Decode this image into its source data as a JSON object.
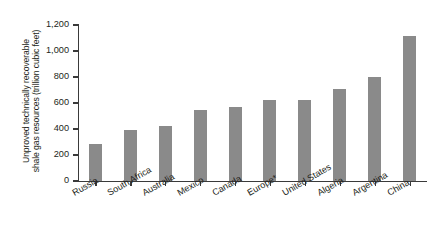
{
  "chart_data": {
    "type": "bar",
    "title": "",
    "subtitle": "",
    "xlabel": "",
    "ylabel": "Unproved technically recoverable shale gas resources (trillion cubic feet)",
    "ylabel_lines": [
      "Unproved technically recoverable",
      "shale gas resources (trillion cubic feet)"
    ],
    "categories": [
      "Russia",
      "South Africa",
      "Australia",
      "Mexico",
      "Canada",
      "Europe*",
      "United States",
      "Algeria",
      "Argentina",
      "China"
    ],
    "values": [
      285,
      390,
      425,
      545,
      573,
      622,
      622,
      707,
      802,
      1115
    ],
    "ylim": [
      0,
      1200
    ],
    "ytick_values": [
      0,
      200,
      400,
      600,
      800,
      1000,
      1200
    ],
    "ytick_labels": [
      "0",
      "200",
      "400",
      "600",
      "800",
      "1,000",
      "1,200"
    ],
    "grid": false,
    "legend": false,
    "legend_position": "none",
    "bar_color": "#8a8a8a",
    "axis_color": "#3a3a3a",
    "annotations": []
  }
}
